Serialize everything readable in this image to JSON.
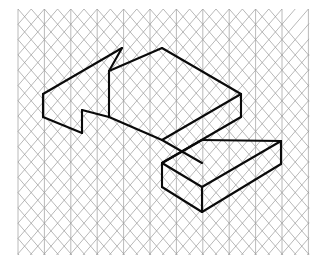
{
  "figure": {
    "background_color": "#ffffff",
    "grid_color": "#9a9a9a",
    "edge_color": "#0a0a0a",
    "canvas": {
      "width": 321,
      "height": 264
    }
  },
  "grid": {
    "type": "isometric-triangular",
    "description": "Triangular / isometric dot-and-line grid made of vertical lines plus 30-degree up-right and down-right diagonals",
    "origin_x": 18,
    "origin_y": 9,
    "cell_width": 26.4,
    "cell_height": 15.3,
    "columns": 11,
    "rows": 17,
    "area": {
      "left": 18,
      "top": 9,
      "right": 309,
      "bottom": 255
    },
    "line_width": 0.7,
    "vertical_line_width": 0.8
  },
  "shape": {
    "name": "stepped-block",
    "kind": "two-tier rectangular prism (L-shaped step solid)",
    "stroke_width": 2.1,
    "vertices": {
      "a_left_top_back": [
        43,
        94
      ],
      "b_peak_left": [
        122,
        48
      ],
      "c_notch_top": [
        109,
        71
      ],
      "d_peak_right": [
        162,
        48
      ],
      "e_right_top": [
        241,
        94
      ],
      "f_right_upper_bottom": [
        241,
        117
      ],
      "g_step_inner_top": [
        202,
        140
      ],
      "h_step_far_right": [
        281,
        141
      ],
      "i_step_right_bottom": [
        281,
        164
      ],
      "j_bottom_vertex": [
        202,
        212
      ],
      "k_step_left_front": [
        162,
        187
      ],
      "l_step_left_top": [
        162,
        163
      ],
      "m_notch_front": [
        109,
        117
      ],
      "n_left_front_bottom": [
        82,
        133
      ],
      "o_left_front_low": [
        82,
        110
      ],
      "p_left_bottom": [
        43,
        117
      ]
    },
    "faces": [
      {
        "name": "upper-top-face",
        "outline": [
          [
            43,
            94
          ],
          [
            122,
            48
          ],
          [
            109,
            71
          ],
          [
            162,
            48
          ],
          [
            241,
            94
          ],
          [
            162,
            140
          ],
          [
            109,
            117
          ],
          [
            82,
            110
          ]
        ]
      },
      {
        "name": "upper-left-front-face",
        "outline": [
          [
            43,
            94
          ],
          [
            82,
            110
          ],
          [
            82,
            133
          ],
          [
            43,
            117
          ]
        ]
      },
      {
        "name": "upper-right-front-face",
        "outline": [
          [
            162,
            140
          ],
          [
            241,
            94
          ],
          [
            241,
            117
          ],
          [
            162,
            163
          ]
        ]
      },
      {
        "name": "lower-step-top-face",
        "outline": [
          [
            162,
            163
          ],
          [
            202,
            140
          ],
          [
            281,
            141
          ],
          [
            202,
            187
          ]
        ]
      },
      {
        "name": "lower-step-left-face",
        "outline": [
          [
            162,
            163
          ],
          [
            202,
            187
          ],
          [
            202,
            212
          ],
          [
            162,
            187
          ]
        ]
      },
      {
        "name": "lower-step-right-face",
        "outline": [
          [
            202,
            187
          ],
          [
            281,
            141
          ],
          [
            281,
            164
          ],
          [
            202,
            212
          ]
        ]
      }
    ],
    "edges": [
      {
        "name": "top-back-left-up",
        "from": [
          43,
          94
        ],
        "to": [
          122,
          48
        ]
      },
      {
        "name": "top-notch-down",
        "from": [
          122,
          48
        ],
        "to": [
          109,
          71
        ]
      },
      {
        "name": "top-notch-up",
        "from": [
          109,
          71
        ],
        "to": [
          162,
          48
        ]
      },
      {
        "name": "top-back-right-down",
        "from": [
          162,
          48
        ],
        "to": [
          241,
          94
        ]
      },
      {
        "name": "upper-right-vertical",
        "from": [
          241,
          94
        ],
        "to": [
          241,
          117
        ]
      },
      {
        "name": "upper-right-front",
        "from": [
          241,
          117
        ],
        "to": [
          162,
          163
        ]
      },
      {
        "name": "upper-front-notch",
        "from": [
          109,
          71
        ],
        "to": [
          109,
          117
        ]
      },
      {
        "name": "notch-front-left",
        "from": [
          109,
          117
        ],
        "to": [
          82,
          110
        ]
      },
      {
        "name": "left-front-vertical",
        "from": [
          82,
          110
        ],
        "to": [
          82,
          133
        ]
      },
      {
        "name": "left-front-bottom",
        "from": [
          82,
          133
        ],
        "to": [
          43,
          117
        ]
      },
      {
        "name": "left-vertical",
        "from": [
          43,
          94
        ],
        "to": [
          43,
          117
        ]
      },
      {
        "name": "upper-front-top",
        "from": [
          109,
          117
        ],
        "to": [
          162,
          140
        ]
      },
      {
        "name": "step-inner-top",
        "from": [
          162,
          140
        ],
        "to": [
          241,
          94
        ]
      },
      {
        "name": "step-inner-run",
        "from": [
          162,
          140
        ],
        "to": [
          202,
          163
        ]
      },
      {
        "name": "step-top-left",
        "from": [
          162,
          163
        ],
        "to": [
          202,
          140
        ]
      },
      {
        "name": "step-top-back",
        "from": [
          202,
          140
        ],
        "to": [
          281,
          141
        ]
      },
      {
        "name": "step-far-right-vert",
        "from": [
          281,
          141
        ],
        "to": [
          281,
          164
        ]
      },
      {
        "name": "step-front-right",
        "from": [
          281,
          164
        ],
        "to": [
          202,
          212
        ]
      },
      {
        "name": "step-front-left",
        "from": [
          202,
          212
        ],
        "to": [
          162,
          187
        ]
      },
      {
        "name": "step-left-vertical",
        "from": [
          162,
          163
        ],
        "to": [
          162,
          187
        ]
      },
      {
        "name": "step-front-mid-vert",
        "from": [
          202,
          187
        ],
        "to": [
          202,
          212
        ]
      },
      {
        "name": "step-front-top-left",
        "from": [
          162,
          163
        ],
        "to": [
          202,
          187
        ]
      },
      {
        "name": "step-front-top-right",
        "from": [
          202,
          187
        ],
        "to": [
          281,
          141
        ]
      }
    ]
  }
}
